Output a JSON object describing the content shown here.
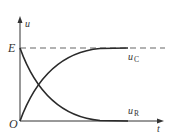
{
  "diagram": {
    "axes": {
      "y_label": "u",
      "x_label": "t",
      "origin_label": "O",
      "level_label": "E"
    },
    "curves": [
      {
        "name": "uC",
        "label_main": "u",
        "label_sub": "C",
        "shape": "rising exponential from 0 to E"
      },
      {
        "name": "uR",
        "label_main": "u",
        "label_sub": "R",
        "shape": "decaying exponential from E to 0"
      }
    ],
    "asymptote": {
      "label": "E",
      "style": "dashed"
    },
    "colors": {
      "stroke": "#2a2a2a",
      "dash": "#555555",
      "text": "#333333"
    }
  }
}
